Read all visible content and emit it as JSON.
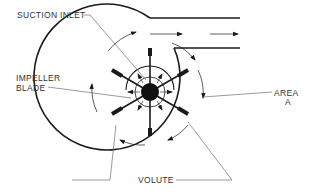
{
  "diagram": {
    "type": "centrifugal fan / pump cross-section",
    "labels": {
      "suction_inlet": "SUCTION INLET",
      "impeller_blade_line1": "IMPELLER",
      "impeller_blade_line2": "BLADE",
      "area_line1": "AREA",
      "area_line2": "A",
      "volute": "VOLUTE"
    },
    "colors": {
      "stroke": "#1a1a1a",
      "leader": "#555555",
      "background": "#ffffff"
    }
  }
}
